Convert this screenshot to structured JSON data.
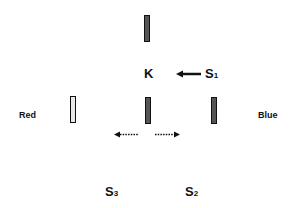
{
  "diagram": {
    "labels": {
      "k": "K",
      "s1": "S",
      "s1_sub": "1",
      "s2": "S",
      "s2_sub": "2",
      "s3": "S",
      "s3_sub": "3",
      "red": "Red",
      "blue": "Blue"
    },
    "bars": [
      {
        "id": "top",
        "fill": "dark"
      },
      {
        "id": "left-red",
        "fill": "light"
      },
      {
        "id": "center",
        "fill": "dark"
      },
      {
        "id": "right-blue",
        "fill": "dark"
      }
    ],
    "arrows": [
      {
        "id": "s1-to-k",
        "style": "solid",
        "direction": "left"
      },
      {
        "id": "center-left",
        "style": "dotted",
        "direction": "left"
      },
      {
        "id": "center-right",
        "style": "dotted",
        "direction": "right"
      }
    ],
    "colors": {
      "bar_dark": "#555555",
      "bar_light": "#e8e8e8",
      "stroke": "#111111",
      "background": "#ffffff"
    }
  }
}
